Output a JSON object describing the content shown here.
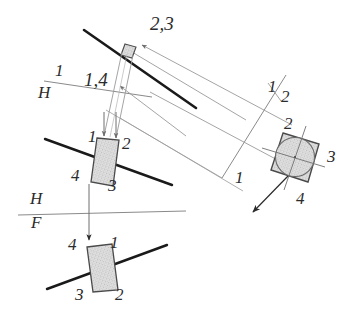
{
  "drawing": {
    "title": "Orthographic projection of a square plate with inscribed circle",
    "colors": {
      "heavy_line": "#1a1a1a",
      "thin_line": "#8a8a8a",
      "object_outline": "#4a4a4a",
      "hatch_fill": "#d9d9d9",
      "label_text": "#2b2b2b",
      "paper": "#ffffff"
    }
  },
  "labels": {
    "top_view_points": "2,3",
    "aux_edge_points": "1,4",
    "fold_1h_upper": "1",
    "fold_1h_lower": "H",
    "fold_hf_upper": "H",
    "fold_hf_lower": "F",
    "fold_12_upper": "1",
    "fold_12_lower": "2",
    "fold_12_left": "1",
    "top_plate_p1": "1",
    "top_plate_p2": "2",
    "top_plate_p4": "4",
    "top_plate_p3": "3",
    "front_plate_p4": "4",
    "front_plate_p1": "1",
    "front_plate_p3": "3",
    "front_plate_p2": "2",
    "square_p2": "2",
    "square_p3": "3",
    "square_p4": "4"
  }
}
